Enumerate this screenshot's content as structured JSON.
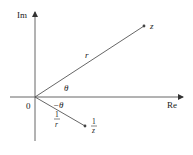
{
  "diagram": {
    "type": "complex-plane",
    "colors": {
      "line": "#555555",
      "text": "#222222",
      "point": "#444444"
    },
    "axes": {
      "real_label": "Re",
      "imag_label": "Im",
      "origin_label": "0"
    },
    "points": {
      "z": {
        "label": "z"
      },
      "inv_z": {
        "label_num": "1",
        "label_den": "z"
      }
    },
    "segments": {
      "r_label": "r",
      "inv_r_label_num": "1",
      "inv_r_label_den": "r"
    },
    "angles": {
      "theta": "θ",
      "neg_theta": "−θ"
    }
  }
}
